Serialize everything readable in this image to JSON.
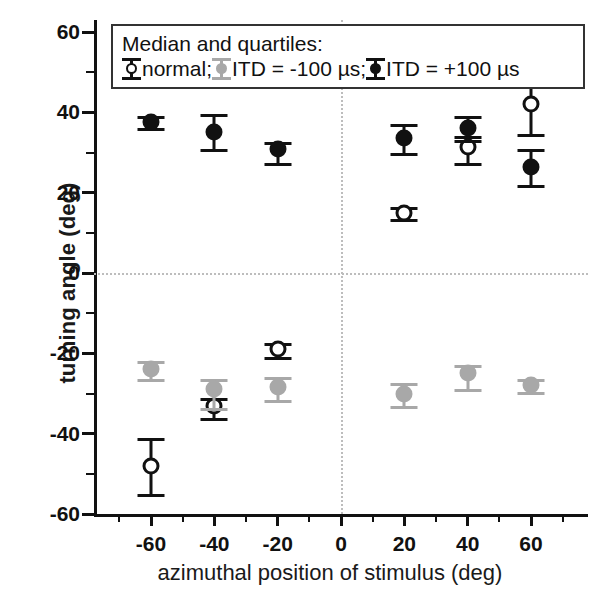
{
  "chart_data": {
    "type": "scatter",
    "title": "",
    "xlabel": "azimuthal position of stimulus (deg)",
    "ylabel": "turning angle (deg)",
    "xlim": [
      -78,
      78
    ],
    "ylim": [
      -60,
      63
    ],
    "xticks": [
      -60,
      -40,
      -20,
      0,
      20,
      40,
      60
    ],
    "xticklabels": [
      "-60",
      "-40",
      "-20",
      "0",
      "20",
      "40",
      "60"
    ],
    "xtick_minor_step": 10,
    "yticks": [
      -60,
      -40,
      -20,
      0,
      20,
      40,
      60
    ],
    "yticklabels": [
      "-60",
      "-40",
      "-20",
      "0",
      "20",
      "40",
      "60"
    ],
    "ytick_minor_step": 10,
    "grid": false,
    "reference_lines": {
      "horizontal": [
        0
      ],
      "vertical": [
        0
      ],
      "style": "dotted",
      "color": "#bdbdbd"
    },
    "legend": {
      "position": "upper-left-inside",
      "title": "Median and quartiles:",
      "entries": [
        {
          "label": "normal;",
          "marker": "open-circle",
          "color": "#111111",
          "fill": "#ffffff"
        },
        {
          "label": "ITD = -100 µs;",
          "marker": "filled-circle",
          "color": "#a8a8a8",
          "fill": "#a8a8a8"
        },
        {
          "label": "ITD = +100 µs",
          "marker": "filled-circle",
          "color": "#111111",
          "fill": "#111111"
        }
      ]
    },
    "x": [
      -60,
      -40,
      -20,
      20,
      40,
      60
    ],
    "series": [
      {
        "name": "normal",
        "marker": "open-circle",
        "color": "#111111",
        "values": [
          -48,
          -33,
          -19,
          15,
          31.5,
          42
        ],
        "lower_quartile": [
          -55,
          -36,
          -21,
          13.5,
          27.5,
          34.5
        ],
        "upper_quartile": [
          -41,
          -31,
          -17.5,
          16.5,
          34,
          48
        ]
      },
      {
        "name": "ITD = -100 µs",
        "marker": "filled-circle",
        "color": "#a8a8a8",
        "values": [
          -24,
          -29,
          -28.5,
          -30,
          -25,
          -28
        ],
        "lower_quartile": [
          -26.5,
          -33.5,
          -31.5,
          -33,
          -29,
          -29.5
        ],
        "upper_quartile": [
          -22,
          -26.5,
          -26,
          -27.5,
          -23,
          -26.5
        ]
      },
      {
        "name": "ITD = +100 µs",
        "marker": "filled-circle",
        "color": "#111111",
        "values": [
          37.5,
          35,
          31,
          33.5,
          36,
          26.5
        ],
        "lower_quartile": [
          36,
          31,
          27.5,
          30,
          33,
          22
        ],
        "upper_quartile": [
          39,
          39.5,
          32.5,
          37,
          39,
          31
        ]
      }
    ]
  }
}
